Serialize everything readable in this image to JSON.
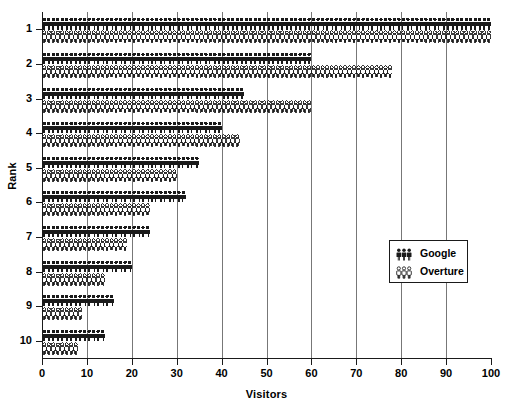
{
  "chart_data": {
    "type": "bar",
    "subtype": "pictogram",
    "title": "",
    "xlabel": "Visitors",
    "ylabel": "Rank",
    "categories": [
      "1",
      "2",
      "3",
      "4",
      "5",
      "6",
      "7",
      "8",
      "9",
      "10"
    ],
    "series": [
      {
        "name": "Google",
        "glyph": "person-filled",
        "color": "#1a1a1a",
        "values": [
          100,
          60,
          45,
          40,
          35,
          32,
          24,
          20,
          16,
          14
        ]
      },
      {
        "name": "Overture",
        "glyph": "person-outline",
        "color": "#1a1a1a",
        "values": [
          100,
          78,
          60,
          44,
          30,
          24,
          19,
          14,
          9,
          8
        ]
      }
    ],
    "xlim": [
      0,
      100
    ],
    "xticks": [
      0,
      10,
      20,
      30,
      40,
      50,
      60,
      70,
      80,
      90,
      100
    ],
    "yticks": [
      "1",
      "2",
      "3",
      "4",
      "5",
      "6",
      "7",
      "8",
      "9",
      "10"
    ],
    "grid": "vertical",
    "gridline_values": [
      10,
      20,
      30,
      40,
      50,
      60,
      70,
      80,
      90
    ],
    "legend_position": "center-right",
    "legend_entries": [
      "Google",
      "Overture"
    ],
    "units_per_glyph": 1,
    "background": "#ffffff",
    "axis_color": "#1a1a1a",
    "grid_color": "#777777"
  },
  "axes": {
    "x_title": "Visitors",
    "y_title": "Rank"
  },
  "legend": {
    "items": [
      {
        "label": "Google",
        "icon": "person-filled-icon"
      },
      {
        "label": "Overture",
        "icon": "person-outline-icon"
      }
    ]
  }
}
